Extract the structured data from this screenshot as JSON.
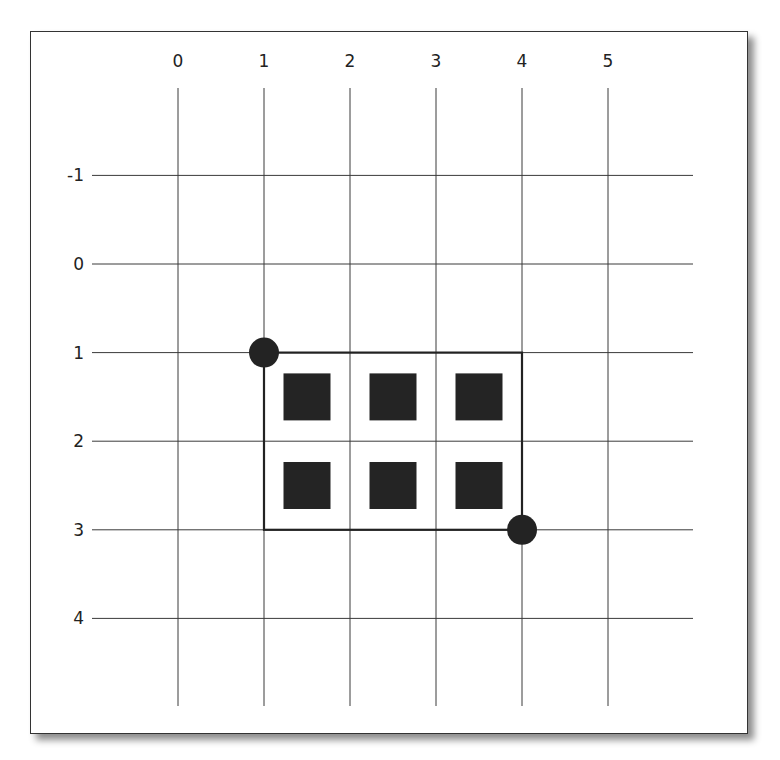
{
  "diagram": {
    "type": "grid-selection",
    "column_labels": [
      "0",
      "1",
      "2",
      "3",
      "4",
      "5"
    ],
    "row_labels": [
      "-1",
      "0",
      "1",
      "2",
      "3",
      "4"
    ],
    "columns": [
      0,
      1,
      2,
      3,
      4,
      5
    ],
    "rows": [
      -1,
      0,
      1,
      2,
      3,
      4
    ],
    "selection": {
      "start": {
        "col": 1,
        "row": 1
      },
      "end": {
        "col": 4,
        "row": 3
      }
    },
    "handles": [
      {
        "name": "start-handle",
        "col": 1,
        "row": 1
      },
      {
        "name": "end-handle",
        "col": 4,
        "row": 3
      }
    ],
    "cells": [
      {
        "col": 1,
        "row": 1
      },
      {
        "col": 2,
        "row": 1
      },
      {
        "col": 3,
        "row": 1
      },
      {
        "col": 1,
        "row": 2
      },
      {
        "col": 2,
        "row": 2
      },
      {
        "col": 3,
        "row": 2
      }
    ],
    "colors": {
      "line": "#3a3a3a",
      "fill": "#242424",
      "background": "#ffffff"
    }
  }
}
